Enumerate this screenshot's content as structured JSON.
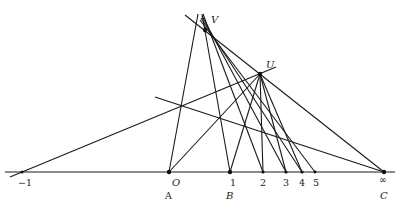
{
  "diagram": {
    "points": {
      "V": {
        "label": "V",
        "x": 205,
        "y": 30
      },
      "U": {
        "label": "U",
        "x": 260,
        "y": 74
      }
    },
    "axis_labels": [
      {
        "label": "−1",
        "x": 22
      },
      {
        "label": "O",
        "x": 169
      },
      {
        "label": "1",
        "x": 230
      },
      {
        "label": "2",
        "x": 263
      },
      {
        "label": "3",
        "x": 286
      },
      {
        "label": "4",
        "x": 302
      },
      {
        "label": "5",
        "x": 315
      },
      {
        "label": "∞",
        "x": 384
      }
    ],
    "bottom_labels": [
      {
        "label": "A",
        "x": 169
      },
      {
        "label": "B",
        "x": 230
      },
      {
        "label": "C",
        "x": 384
      }
    ]
  }
}
